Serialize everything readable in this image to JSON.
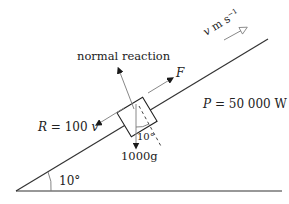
{
  "diagram": {
    "labels": {
      "normal_reaction": "normal reaction",
      "driving_force": "F",
      "resistance_lhs": "R",
      "resistance_rhs": " = 100 ",
      "resistance_var": "v",
      "power_lhs": "P",
      "power_rhs": " = 50 000 W",
      "weight": "1000g",
      "angle_incline": "10°",
      "angle_weight": "10°",
      "velocity_var": "v",
      "velocity_unit": " m s",
      "velocity_exp": "−1"
    },
    "colors": {
      "line": "#333333",
      "arrow": "#1a1a1a",
      "text": "#222222",
      "dashed": "#444444"
    }
  }
}
